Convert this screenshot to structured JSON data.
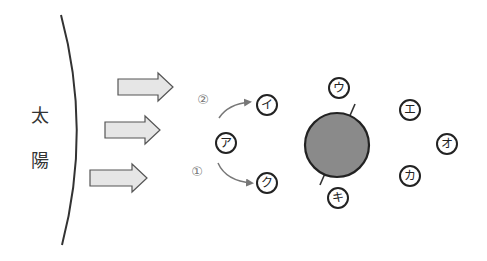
{
  "sun": {
    "label_chars": [
      "太",
      "陽"
    ]
  },
  "orbit_labels": {
    "path1": "①",
    "path2": "②"
  },
  "positions": [
    {
      "id": "a",
      "label": "ア",
      "x": 226,
      "y": 143
    },
    {
      "id": "i",
      "label": "イ",
      "x": 267,
      "y": 105
    },
    {
      "id": "u",
      "label": "ウ",
      "x": 339,
      "y": 88
    },
    {
      "id": "e",
      "label": "エ",
      "x": 410,
      "y": 110
    },
    {
      "id": "o",
      "label": "オ",
      "x": 447,
      "y": 144
    },
    {
      "id": "ka",
      "label": "カ",
      "x": 410,
      "y": 176
    },
    {
      "id": "ki",
      "label": "キ",
      "x": 338,
      "y": 198
    },
    {
      "id": "ku",
      "label": "ク",
      "x": 267,
      "y": 183
    }
  ],
  "colors": {
    "earth_fill": "#8a8a8a",
    "arrow_fill": "#e6e6e6",
    "stroke": "#222222",
    "curve_arrow": "#777777"
  }
}
